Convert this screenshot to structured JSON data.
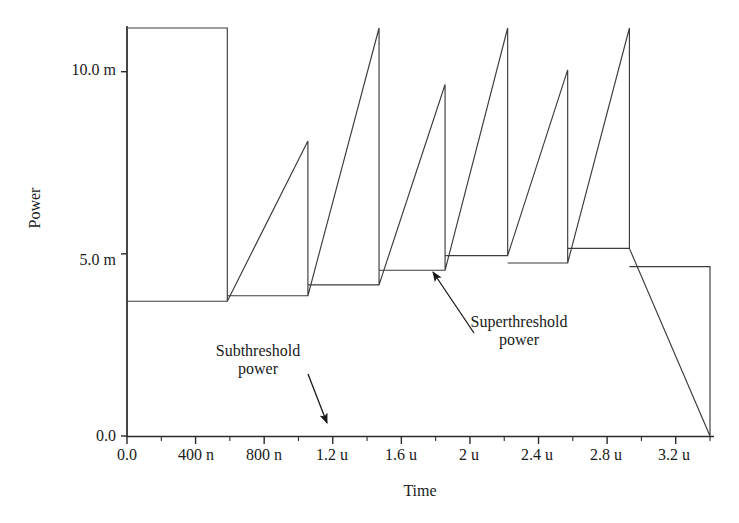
{
  "chart_data": {
    "type": "line",
    "title": "",
    "xlabel": "Time",
    "ylabel": "Power",
    "xlim": [
      0,
      3.4e-06
    ],
    "ylim": [
      0,
      0.0112
    ],
    "grid": false,
    "legend": "none",
    "x_unit": "s",
    "y_unit": "W",
    "xticks": [
      {
        "value": 0.0,
        "label": "0.0"
      },
      {
        "value": 4e-07,
        "label": "400 n"
      },
      {
        "value": 8e-07,
        "label": "800 n"
      },
      {
        "value": 1.2e-06,
        "label": "1.2 u"
      },
      {
        "value": 1.6e-06,
        "label": "1.6 u"
      },
      {
        "value": 2e-06,
        "label": "2 u"
      },
      {
        "value": 2.4e-06,
        "label": "2.4 u"
      },
      {
        "value": 2.8e-06,
        "label": "2.8 u"
      },
      {
        "value": 3.2e-06,
        "label": "3.2 u"
      }
    ],
    "xminorticks": [
      2e-07,
      6e-07,
      1e-06,
      1.4e-06,
      1.8e-06,
      2.2e-06,
      2.6e-06,
      3e-06,
      3.4e-06
    ],
    "yticks": [
      {
        "value": 0.0,
        "label": "0.0"
      },
      {
        "value": 0.005,
        "label": "5.0 m"
      },
      {
        "value": 0.01,
        "label": "10.0 m"
      }
    ],
    "series": [
      {
        "name": "Power",
        "color": "#3c3c3c",
        "description": "Sawtooth optical pulse train: low subthreshold plateau followed by a sharp superthreshold spike each period",
        "points": [
          [
            0.0,
            0.0
          ],
          [
            0.0,
            0.0112
          ],
          [
            5.85e-07,
            0.0112
          ],
          [
            5.85e-07,
            0.0037
          ],
          [
            0.0,
            0.0037
          ],
          [
            0.0,
            0.0
          ],
          [
            5.85e-07,
            0.0037
          ],
          [
            5.85e-07,
            0.0081
          ],
          [
            1.055e-06,
            0.0081
          ],
          [
            1.055e-06,
            0.00385
          ],
          [
            5.85e-07,
            0.00385
          ]
        ],
        "segments": [
          {
            "t_start": 0.0,
            "t_end": 5.85e-07,
            "plateau": 0.0037,
            "spike_peak": 0.0112
          },
          {
            "t_start": 5.85e-07,
            "t_end": 1.055e-06,
            "plateau": 0.00385,
            "spike_peak": 0.0081
          },
          {
            "t_start": 1.055e-06,
            "t_end": 1.47e-06,
            "plateau": 0.00415,
            "spike_peak": 0.0112
          },
          {
            "t_start": 1.47e-06,
            "t_end": 1.855e-06,
            "plateau": 0.00455,
            "spike_peak": 0.00965
          },
          {
            "t_start": 1.855e-06,
            "t_end": 2.22e-06,
            "plateau": 0.00495,
            "spike_peak": 0.0112
          },
          {
            "t_start": 2.22e-06,
            "t_end": 2.57e-06,
            "plateau": 0.00475,
            "spike_peak": 0.01005
          },
          {
            "t_start": 2.57e-06,
            "t_end": 2.93e-06,
            "plateau": 0.00515,
            "spike_peak": 0.0112
          },
          {
            "t_start": 2.93e-06,
            "t_end": 3.4e-06,
            "plateau": 0.00465,
            "spike_peak": 0.0
          }
        ]
      }
    ],
    "annotations": [
      {
        "id": "subthreshold",
        "text_line1": "Subthreshold",
        "text_line2": "power",
        "text_x": 0.00062,
        "text_y": 0.00235,
        "arrow_from": [
          0.00118,
          0.00176
        ],
        "arrow_to": [
          0.00132,
          0.00044
        ]
      },
      {
        "id": "superthreshold",
        "text_line1": "Superthreshold",
        "text_line2": "power",
        "text_x": 0.00243,
        "text_y": 0.00259,
        "arrow_from": [
          0.00219,
          0.00289
        ],
        "arrow_to": [
          0.0019,
          0.00455
        ]
      }
    ]
  },
  "axes": {
    "ylabel": "Power",
    "xlabel": "Time"
  },
  "colors": {
    "line": "#3c3c3c",
    "axis": "#2b2b2b",
    "text": "#1a1a1a",
    "background": "#ffffff"
  }
}
